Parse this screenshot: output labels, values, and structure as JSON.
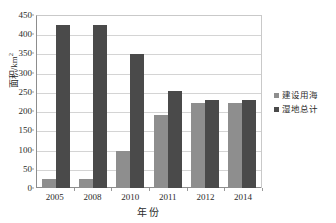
{
  "chart_data": {
    "type": "bar",
    "title": "",
    "xlabel": "年份",
    "ylabel": "面积/km2",
    "ylabel_base": "面积/km",
    "ylabel_sup": "2",
    "categories": [
      "2005",
      "2008",
      "2010",
      "2011",
      "2012",
      "2014"
    ],
    "series": [
      {
        "name": "建设用海",
        "color": "#8e8e8e",
        "values": [
          23,
          23,
          97,
          190,
          220,
          220
        ]
      },
      {
        "name": "湿地总计",
        "color": "#4a4a4a",
        "values": [
          424,
          424,
          349,
          252,
          228,
          228
        ]
      }
    ],
    "ylim": [
      0,
      450
    ],
    "ytick_step": 50,
    "yticks": [
      "450",
      "400",
      "350",
      "300",
      "250",
      "200",
      "150",
      "100",
      "50",
      "0"
    ],
    "grid": true,
    "grid_axis": "y",
    "legend_position": "right"
  }
}
